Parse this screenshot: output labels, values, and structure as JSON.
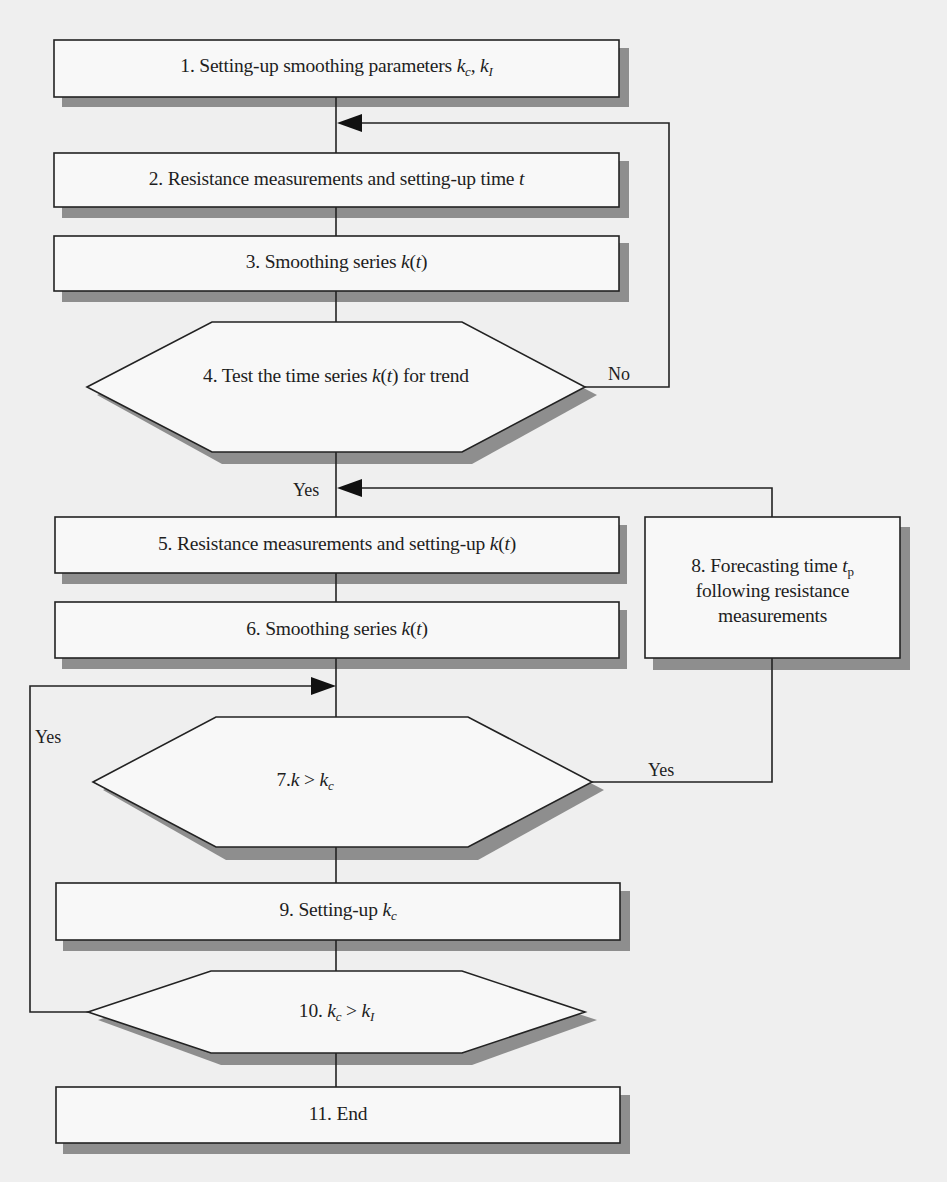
{
  "diagram": {
    "type": "flowchart",
    "colors": {
      "background": "#efefef",
      "box_fill": "#f8f8f8",
      "stroke": "#222222",
      "shadow": "#8e8e8e"
    },
    "nodes": [
      {
        "id": "1",
        "shape": "rect",
        "number": "1.",
        "text": "Setting-up smoothing parameters",
        "math": [
          {
            "var": "k",
            "sub": "c",
            "sep": ", "
          },
          {
            "var": "k",
            "sub": "I"
          }
        ]
      },
      {
        "id": "2",
        "shape": "rect",
        "number": "2.",
        "text": "Resistance measurements and setting-up time",
        "math_tail": "t"
      },
      {
        "id": "3",
        "shape": "rect",
        "number": "3.",
        "text": "Smoothing series",
        "math_tail": "k(t)"
      },
      {
        "id": "4",
        "shape": "hexagon",
        "number": "4.",
        "text_before": "Test the time series",
        "math_mid": "k(t)",
        "text_after": "for trend"
      },
      {
        "id": "5",
        "shape": "rect",
        "number": "5.",
        "text": "Resistance measurements and setting-up",
        "math_tail": "k(t)"
      },
      {
        "id": "6",
        "shape": "rect",
        "number": "6.",
        "text": "Smoothing series",
        "math_tail": "k(t)"
      },
      {
        "id": "7",
        "shape": "hexagon",
        "number": "7.",
        "expr": "k > k_c"
      },
      {
        "id": "8",
        "shape": "rect",
        "number": "8.",
        "lines": [
          "Forecasting time",
          "following resistance",
          "measurements"
        ],
        "math_tail": "t_p"
      },
      {
        "id": "9",
        "shape": "rect",
        "number": "9.",
        "text": "Setting-up",
        "math_tail": "k_c"
      },
      {
        "id": "10",
        "shape": "hexagon",
        "number": "10.",
        "expr": "k_c > k_I"
      },
      {
        "id": "11",
        "shape": "rect",
        "number": "11.",
        "text": "End"
      }
    ],
    "edges": [
      {
        "from": "1",
        "to": "2"
      },
      {
        "from": "2",
        "to": "3"
      },
      {
        "from": "3",
        "to": "4"
      },
      {
        "from": "4",
        "to": "2",
        "label": "No"
      },
      {
        "from": "4",
        "to": "5",
        "label": "Yes"
      },
      {
        "from": "5",
        "to": "6"
      },
      {
        "from": "6",
        "to": "7"
      },
      {
        "from": "7",
        "to": "8",
        "label": "Yes"
      },
      {
        "from": "8",
        "to": "5"
      },
      {
        "from": "7",
        "to": "9"
      },
      {
        "from": "9",
        "to": "10"
      },
      {
        "from": "10",
        "to": "7",
        "label": "Yes"
      },
      {
        "from": "10",
        "to": "11"
      }
    ],
    "labels": {
      "n1": {
        "num": "1.",
        "text": "Setting-up smoothing parameters",
        "v1": "k",
        "s1": "c",
        "sep": ", ",
        "v2": "k",
        "s2": "I"
      },
      "n2": {
        "num": "2.",
        "text": "Resistance measurements and setting-up time",
        "v": "t"
      },
      "n3": {
        "num": "3.",
        "text": "Smoothing series",
        "v": "k",
        "open": "(",
        "arg": "t",
        "close": ")"
      },
      "n4": {
        "num": "4.",
        "before": "Test the time series",
        "v": "k",
        "open": "(",
        "arg": "t",
        "close": ")",
        "after": "for trend"
      },
      "n5": {
        "num": "5.",
        "text": "Resistance measurements and setting-up",
        "v": "k",
        "open": "(",
        "arg": "t",
        "close": ")"
      },
      "n6": {
        "num": "6.",
        "text": "Smoothing series",
        "v": "k",
        "open": "(",
        "arg": "t",
        "close": ")"
      },
      "n7": {
        "num": "7.",
        "v1": "k",
        "op": " > ",
        "v2": "k",
        "s2": "c"
      },
      "n8": {
        "num": "8.",
        "line1": "Forecasting time",
        "v": "t",
        "s": "p",
        "line2": "following resistance",
        "line3": "measurements"
      },
      "n9": {
        "num": "9.",
        "text": "Setting-up",
        "v": "k",
        "s": "c"
      },
      "n10": {
        "num": "10.",
        "v1": "k",
        "s1": "c",
        "op": " > ",
        "v2": "k",
        "s2": "I"
      },
      "n11": {
        "num": "11.",
        "text": "End"
      },
      "edge_no": "No",
      "edge_yes_4": "Yes",
      "edge_yes_7_left": "Yes",
      "edge_yes_7_right": "Yes"
    }
  }
}
